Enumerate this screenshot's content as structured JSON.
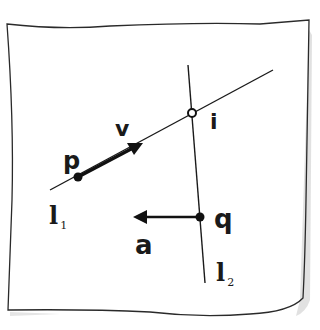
{
  "diagram": {
    "kind": "hand-drawn geometry sketch",
    "colors": {
      "ink": "#1a1a1a",
      "shadow": "#c8c8c8",
      "paper": "#ffffff"
    },
    "lines": [
      {
        "name": "l1",
        "label": "l",
        "subscript": "1",
        "from": [
          50,
          190
        ],
        "to": [
          273,
          70
        ]
      },
      {
        "name": "l2",
        "label": "l",
        "subscript": "2",
        "from": [
          188,
          65
        ],
        "to": [
          205,
          283
        ]
      }
    ],
    "points": [
      {
        "name": "p",
        "label": "p",
        "at": [
          78,
          177
        ],
        "style": "filled"
      },
      {
        "name": "q",
        "label": "q",
        "at": [
          200,
          217
        ],
        "style": "filled"
      },
      {
        "name": "i",
        "label": "i",
        "at": [
          192,
          113
        ],
        "style": "open"
      }
    ],
    "vectors": [
      {
        "name": "v",
        "label": "v",
        "from": [
          78,
          177
        ],
        "to": [
          143,
          143
        ]
      },
      {
        "name": "a",
        "label": "a",
        "from": [
          200,
          217
        ],
        "to": [
          133,
          217
        ]
      }
    ]
  }
}
